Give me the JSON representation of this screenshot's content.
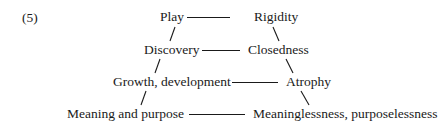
{
  "figure": {
    "number": "(5)",
    "rows": [
      {
        "left": "Play",
        "right": "Rigidity"
      },
      {
        "left": "Discovery",
        "right": "Closedness"
      },
      {
        "left": "Growth, development",
        "right": "Atrophy"
      },
      {
        "left": "Meaning and purpose",
        "right": "Meaninglessness, purposelessness"
      }
    ]
  }
}
